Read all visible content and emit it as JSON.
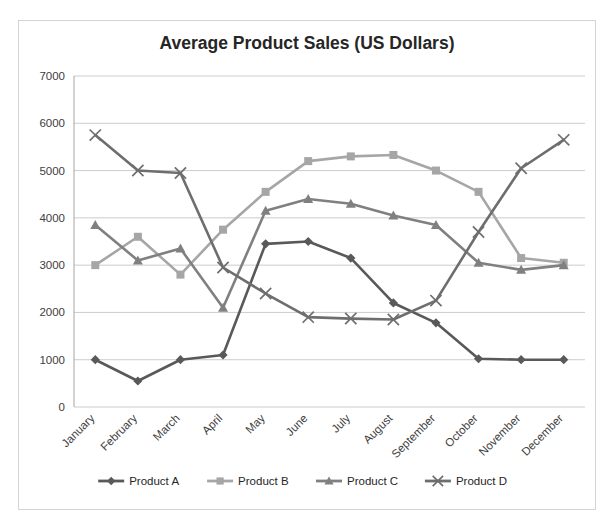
{
  "chart_data": {
    "type": "line",
    "title": "Average Product Sales (US Dollars)",
    "xlabel": "",
    "ylabel": "",
    "ylim": [
      0,
      7000
    ],
    "ytick_step": 1000,
    "grid": true,
    "legend_position": "bottom",
    "categories": [
      "January",
      "February",
      "March",
      "April",
      "May",
      "June",
      "July",
      "August",
      "September",
      "October",
      "November",
      "December"
    ],
    "ytick_labels": [
      "0",
      "1000",
      "2000",
      "3000",
      "4000",
      "5000",
      "6000",
      "7000"
    ],
    "series": [
      {
        "name": "Product A",
        "color": "#595959",
        "marker": "diamond",
        "values": [
          1000,
          550,
          1000,
          1100,
          3450,
          3500,
          3150,
          2200,
          1780,
          1020,
          1000,
          1000
        ]
      },
      {
        "name": "Product B",
        "color": "#a6a6a6",
        "marker": "square",
        "values": [
          3000,
          3600,
          2800,
          3750,
          4550,
          5200,
          5300,
          5330,
          5000,
          4550,
          3150,
          3050
        ]
      },
      {
        "name": "Product C",
        "color": "#808080",
        "marker": "triangle",
        "values": [
          3850,
          3100,
          3350,
          2100,
          4150,
          4400,
          4300,
          4050,
          3850,
          3050,
          2900,
          3000
        ]
      },
      {
        "name": "Product D",
        "color": "#6e6e6e",
        "marker": "cross",
        "values": [
          5750,
          5000,
          4950,
          2950,
          2400,
          1900,
          1870,
          1850,
          2250,
          3700,
          5050,
          5650
        ]
      }
    ]
  }
}
